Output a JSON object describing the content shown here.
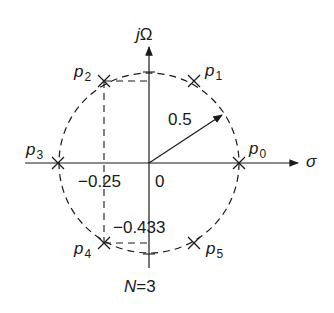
{
  "diagram": {
    "title_parts": {
      "var": "N",
      "eq": "=3"
    },
    "axes": {
      "horizontal": {
        "label": "σ"
      },
      "vertical": {
        "label_j": "j",
        "label_omega": "Ω"
      }
    },
    "circle": {
      "radius_label": "0.5",
      "style": "dashed"
    },
    "origin_label": "0",
    "ticks": {
      "real": "−0.25",
      "imag": "−0.433"
    },
    "poles": [
      {
        "id": "p0",
        "name": "p",
        "sub": "0"
      },
      {
        "id": "p1",
        "name": "p",
        "sub": "1"
      },
      {
        "id": "p2",
        "name": "p",
        "sub": "2"
      },
      {
        "id": "p3",
        "name": "p",
        "sub": "3"
      },
      {
        "id": "p4",
        "name": "p",
        "sub": "4"
      },
      {
        "id": "p5",
        "name": "p",
        "sub": "5"
      }
    ],
    "colors": {
      "ink": "#1a1a1a",
      "background": "#ffffff"
    }
  }
}
